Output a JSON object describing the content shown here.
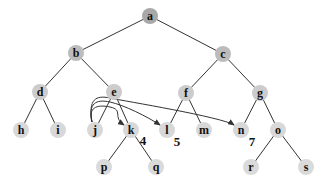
{
  "diagram": {
    "type": "tree",
    "node_radius": 8,
    "colors": {
      "level0": "#a8a8a8",
      "level1": "#bcbcbc",
      "level2": "#cccccc",
      "level3": "#d8d8d8",
      "level4": "#dadada",
      "edge": "#333333"
    },
    "nodes": [
      {
        "id": "a",
        "label": "a",
        "x": 150,
        "y": 16,
        "level": 0
      },
      {
        "id": "b",
        "label": "b",
        "x": 76,
        "y": 53,
        "level": 1
      },
      {
        "id": "c",
        "label": "c",
        "x": 223,
        "y": 54,
        "level": 1
      },
      {
        "id": "d",
        "label": "d",
        "x": 40,
        "y": 92,
        "level": 2
      },
      {
        "id": "e",
        "label": "e",
        "x": 114,
        "y": 92,
        "level": 2
      },
      {
        "id": "f",
        "label": "f",
        "x": 186,
        "y": 93,
        "level": 2
      },
      {
        "id": "g",
        "label": "g",
        "x": 260,
        "y": 93,
        "level": 2
      },
      {
        "id": "h",
        "label": "h",
        "x": 21,
        "y": 130,
        "level": 3
      },
      {
        "id": "i",
        "label": "i",
        "x": 58,
        "y": 130,
        "level": 3
      },
      {
        "id": "j",
        "label": "j",
        "x": 95,
        "y": 130,
        "level": 3
      },
      {
        "id": "k",
        "label": "k",
        "x": 131,
        "y": 130,
        "level": 3
      },
      {
        "id": "l",
        "label": "l",
        "x": 167,
        "y": 130,
        "level": 3
      },
      {
        "id": "m",
        "label": "m",
        "x": 204,
        "y": 130,
        "level": 3
      },
      {
        "id": "n",
        "label": "n",
        "x": 241,
        "y": 130,
        "level": 3
      },
      {
        "id": "o",
        "label": "o",
        "x": 278,
        "y": 130,
        "level": 3
      },
      {
        "id": "p",
        "label": "p",
        "x": 104,
        "y": 167,
        "level": 4
      },
      {
        "id": "q",
        "label": "q",
        "x": 156,
        "y": 167,
        "level": 4
      },
      {
        "id": "r",
        "label": "r",
        "x": 251,
        "y": 167,
        "level": 4
      },
      {
        "id": "s",
        "label": "s",
        "x": 306,
        "y": 167,
        "level": 4
      }
    ],
    "edges": [
      [
        "a",
        "b"
      ],
      [
        "a",
        "c"
      ],
      [
        "b",
        "d"
      ],
      [
        "b",
        "e"
      ],
      [
        "c",
        "f"
      ],
      [
        "c",
        "g"
      ],
      [
        "d",
        "h"
      ],
      [
        "d",
        "i"
      ],
      [
        "e",
        "j"
      ],
      [
        "e",
        "k"
      ],
      [
        "f",
        "l"
      ],
      [
        "f",
        "m"
      ],
      [
        "g",
        "n"
      ],
      [
        "g",
        "o"
      ],
      [
        "k",
        "p"
      ],
      [
        "k",
        "q"
      ],
      [
        "o",
        "r"
      ],
      [
        "o",
        "s"
      ]
    ],
    "arrows": [
      {
        "from": "j",
        "to": "k",
        "peak_y": 110
      },
      {
        "from": "j",
        "to": "l",
        "peak_y": 105
      },
      {
        "from": "j",
        "to": "n",
        "peak_y": 101
      }
    ],
    "annotations": [
      {
        "text": "4",
        "x": 143,
        "y": 145,
        "near": "k"
      },
      {
        "text": "5",
        "x": 177,
        "y": 146,
        "near": "l"
      },
      {
        "text": "7",
        "x": 252,
        "y": 146,
        "near": "n"
      }
    ]
  }
}
